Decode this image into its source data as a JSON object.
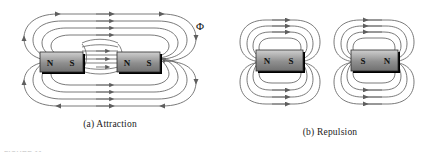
{
  "figure": {
    "background_color": "#ffffff",
    "field_line_color": "#6b6b6b",
    "magnet_edge_color": "#2b2b2b",
    "shadow_color": "#000000",
    "label_color": "#1a1a1a",
    "footer_text": "FIGURE 11"
  },
  "panels": [
    {
      "id": "attraction",
      "caption": "(a) Attraction",
      "flux_symbol": "Φ",
      "flux_symbol_name": "magnetic-flux-phi",
      "magnets": [
        {
          "id": "left-magnet",
          "pole_left": "N",
          "pole_right": "S"
        },
        {
          "id": "right-magnet",
          "pole_left": "N",
          "pole_right": "S"
        }
      ],
      "gap_field": "horizontal-bulging-lines",
      "arrow_direction": "rightward"
    },
    {
      "id": "repulsion",
      "caption": "(b) Repulsion",
      "flux_symbol": "Φ",
      "flux_symbol_name": "magnetic-flux-phi",
      "magnets": [
        {
          "id": "left-magnet",
          "pole_left": "N",
          "pole_right": "S"
        },
        {
          "id": "right-magnet",
          "pole_left": "S",
          "pole_right": "N"
        }
      ],
      "gap_field": "opposing-separated-loops",
      "arrow_direction": "outward-from-gap"
    }
  ]
}
